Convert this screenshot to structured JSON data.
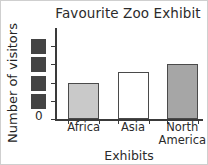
{
  "chart_data": {
    "type": "bar",
    "title": "Favourite Zoo Exhibit",
    "xlabel": "Exhibits",
    "ylabel": "Number of visitors",
    "categories": [
      "Africa",
      "Asia",
      "North America"
    ],
    "category_lines": [
      [
        "Africa"
      ],
      [
        "Asia"
      ],
      [
        "North",
        "America"
      ]
    ],
    "values": [
      2.0,
      2.6,
      3.0
    ],
    "bar_colors": [
      "#c9c9c9",
      "#ffffff",
      "#a6a6a6"
    ],
    "bar_edge_color": "#4a4a4a",
    "ylim": [
      0,
      5
    ],
    "ytick_values": [
      0,
      1,
      2,
      3,
      4
    ],
    "ytick_labels": [
      "0",
      "",
      "",
      "",
      ""
    ],
    "ytick_labels_obscured": true,
    "ytick_obscured_count": 4,
    "obscured_block_color": "#444444",
    "zero_label": "0",
    "grid": false,
    "legend": "none",
    "axis_color": "#3a3a3a",
    "background": "#ffffff",
    "border_color": "#cfcfcf"
  }
}
